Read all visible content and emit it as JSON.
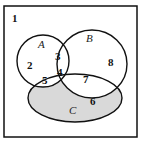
{
  "diagram": {
    "type": "venn",
    "universe_label": "1",
    "shaded_color": "#d9d9d9",
    "stroke_color": "#111111",
    "sets": [
      {
        "name": "A",
        "label": "A"
      },
      {
        "name": "B",
        "label": "B"
      },
      {
        "name": "C",
        "label": "C",
        "shaded": true
      }
    ],
    "regions": [
      {
        "id": "2",
        "label": "2"
      },
      {
        "id": "3",
        "label": "3"
      },
      {
        "id": "4",
        "label": "4"
      },
      {
        "id": "5",
        "label": "5"
      },
      {
        "id": "6",
        "label": "6"
      },
      {
        "id": "7",
        "label": "7"
      },
      {
        "id": "8",
        "label": "8"
      }
    ]
  }
}
